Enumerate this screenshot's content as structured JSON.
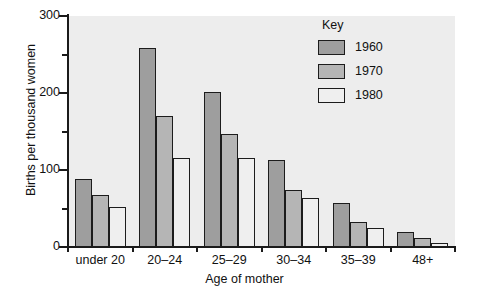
{
  "chart_data": {
    "type": "bar",
    "title": "",
    "xlabel": "Age of mother",
    "ylabel": "Births per thousand women",
    "categories": [
      "under 20",
      "20–24",
      "25–29",
      "30–34",
      "35–39",
      "48+"
    ],
    "series": [
      {
        "name": "1960",
        "color": "#9e9e9e",
        "values": [
          88,
          259,
          201,
          113,
          57,
          19
        ]
      },
      {
        "name": "1970",
        "color": "#b5b5b5",
        "values": [
          68,
          170,
          147,
          74,
          32,
          12
        ]
      },
      {
        "name": "1980",
        "color": "#efefef",
        "values": [
          52,
          116,
          115,
          64,
          25,
          5
        ]
      }
    ],
    "ylim": [
      0,
      300
    ],
    "y_major_ticks": [
      0,
      100,
      200,
      300
    ],
    "y_minor_ticks": [
      50,
      150,
      250
    ],
    "y_tick_labels": [
      "0",
      "100",
      "200",
      "300"
    ],
    "grid": false,
    "legend_position": "top-right",
    "legend_title": "Key",
    "plot_background": "#ededed",
    "axis_color": "#1a1a1a",
    "bar_border_color": "#1c1c1c"
  },
  "legend": {
    "title": "Key",
    "entries": [
      {
        "label": "1960",
        "color": "#9e9e9e"
      },
      {
        "label": "1970",
        "color": "#b5b5b5"
      },
      {
        "label": "1980",
        "color": "#efefef"
      }
    ]
  },
  "axes": {
    "y_title": "Births per thousand women",
    "x_title": "Age of mother",
    "y_labels": [
      "300",
      "200",
      "100",
      "0"
    ],
    "x_labels": [
      "under 20",
      "20–24",
      "25–29",
      "30–34",
      "35–39",
      "48+"
    ]
  }
}
